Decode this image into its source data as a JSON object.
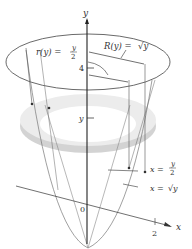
{
  "figure": {
    "axes": {
      "y_label": "y",
      "x_label": "x",
      "origin_label": "0",
      "y_tick_label": "4",
      "x_tick_label": "2",
      "slice_label": "y"
    },
    "annotations": {
      "inner_radius": "r(y) = y/2",
      "inner_radius_lhs": "r(y) =",
      "inner_radius_num": "y",
      "inner_radius_den": "2",
      "outer_radius": "R(y) = √y",
      "outer_radius_lhs": "R(y) =",
      "outer_radius_rhs": "√y",
      "line_curve": "x = y/2",
      "line_lhs": "x =",
      "line_num": "y",
      "line_den": "2",
      "parabola_curve": "x = √y",
      "parabola_lhs": "x =",
      "parabola_rhs": "√y"
    },
    "colors": {
      "ink": "#333333",
      "washer_fill": "#d9d9d9",
      "washer_shade": "#bdbdbd",
      "axis": "#222222"
    }
  }
}
